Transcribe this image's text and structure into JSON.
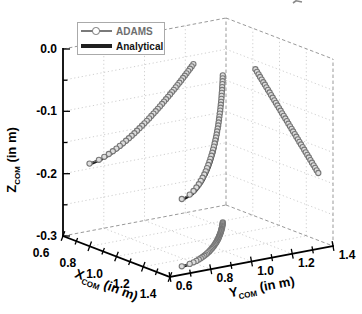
{
  "colors": {
    "background": "#ffffff",
    "axis": "#000000",
    "grid": "#c9c9c9",
    "box_dash": "#999999",
    "adams_stroke": "#777777",
    "adams_fill": "#dddddd",
    "analytical": "#202020",
    "legend_border": "#aaaaaa",
    "tick_text": "#000000"
  },
  "axes": {
    "x": {
      "sym": "X",
      "sub": "COM",
      "unit": " (in m)",
      "min": 0.6,
      "max": 1.4,
      "tick_values": [
        0.6,
        0.8,
        1.0,
        1.2,
        1.4
      ],
      "tick_labels": [
        "0.6",
        "0.8",
        "1.0",
        "1.2",
        "1.4"
      ],
      "minor_tick_step": 0.1
    },
    "y": {
      "sym": "Y",
      "sub": "COM",
      "unit": " (in m)",
      "min": 0.6,
      "max": 1.4,
      "tick_values": [
        0.6,
        0.8,
        1.0,
        1.2,
        1.4
      ],
      "tick_labels": [
        "0.6",
        "0.8",
        "1.0",
        "1.2",
        "1.4"
      ],
      "minor_tick_step": 0.1
    },
    "z": {
      "sym": "Z",
      "sub": "COM",
      "unit": " (in m)",
      "min": -0.3,
      "max": 0.0,
      "tick_values": [
        0,
        -0.1,
        -0.2,
        -0.3
      ],
      "tick_labels": [
        "0.0",
        "-0.1",
        "-0.2",
        "-0.3"
      ],
      "minor_tick_step": 0.05,
      "grid_step": 0.05
    }
  },
  "legend": {
    "position": "upper-left",
    "items": [
      {
        "label": "ADAMS",
        "marker": "circle-on-line",
        "color": "#777777"
      },
      {
        "label": "Analytical",
        "marker": "thick-line",
        "color": "#202020"
      }
    ]
  },
  "chart_data": {
    "type": "line",
    "plot_style": "3d-trajectory-with-wall-and-floor-projections",
    "title": "",
    "xlabel": "X_COM (in m)",
    "ylabel": "Y_COM (in m)",
    "zlabel": "Z_COM (in m)",
    "xlim": [
      0.6,
      1.4
    ],
    "ylim": [
      0.6,
      1.4
    ],
    "zlim": [
      -0.3,
      0.0
    ],
    "grid": true,
    "legend_position": "upper-left",
    "projections_drawn": [
      "floor z=-0.3",
      "wall x=0.6",
      "wall y=1.4",
      "main 3d curve"
    ],
    "series": [
      {
        "name": "ADAMS",
        "style": "line+circle-markers",
        "color": "#777777",
        "points3d": [
          [
            0.82,
            1.24,
            -0.064
          ],
          [
            0.8318,
            1.2317,
            -0.0672
          ],
          [
            0.8435,
            1.2233,
            -0.0704
          ],
          [
            0.8553,
            1.2148,
            -0.0736
          ],
          [
            0.867,
            1.2062,
            -0.0768
          ],
          [
            0.8788,
            1.1976,
            -0.08
          ],
          [
            0.8905,
            1.1889,
            -0.0832
          ],
          [
            0.9023,
            1.1801,
            -0.0864
          ],
          [
            0.914,
            1.1711,
            -0.0896
          ],
          [
            0.9258,
            1.1621,
            -0.0928
          ],
          [
            0.9375,
            1.153,
            -0.096
          ],
          [
            0.9493,
            1.1438,
            -0.0992
          ],
          [
            0.961,
            1.1345,
            -0.1024
          ],
          [
            0.9728,
            1.125,
            -0.1056
          ],
          [
            0.9845,
            1.1154,
            -0.1088
          ],
          [
            0.9963,
            1.1057,
            -0.112
          ],
          [
            1.008,
            1.0959,
            -0.1152
          ],
          [
            1.0198,
            1.0859,
            -0.1184
          ],
          [
            1.0315,
            1.0758,
            -0.1216
          ],
          [
            1.0433,
            1.0655,
            -0.1248
          ],
          [
            1.055,
            1.055,
            -0.128
          ],
          [
            1.0668,
            1.0444,
            -0.1312
          ],
          [
            1.0785,
            1.0335,
            -0.1344
          ],
          [
            1.0903,
            1.0224,
            -0.1376
          ],
          [
            1.102,
            1.0111,
            -0.1408
          ],
          [
            1.1138,
            0.9996,
            -0.144
          ],
          [
            1.1255,
            0.9878,
            -0.1472
          ],
          [
            1.1373,
            0.9756,
            -0.1504
          ],
          [
            1.149,
            0.9632,
            -0.1536
          ],
          [
            1.1608,
            0.9504,
            -0.1568
          ],
          [
            1.1725,
            0.9371,
            -0.16
          ],
          [
            1.1843,
            0.9234,
            -0.1632
          ],
          [
            1.196,
            0.9091,
            -0.1664
          ],
          [
            1.2078,
            0.8943,
            -0.1696
          ],
          [
            1.2195,
            0.8786,
            -0.1728
          ],
          [
            1.2313,
            0.862,
            -0.176
          ],
          [
            1.243,
            0.8442,
            -0.1792
          ],
          [
            1.2548,
            0.8247,
            -0.1824
          ],
          [
            1.2665,
            0.8028,
            -0.1856
          ],
          [
            1.2783,
            0.7764,
            -0.1888
          ],
          [
            1.29,
            0.73,
            -0.192
          ]
        ]
      },
      {
        "name": "Analytical",
        "style": "solid-line",
        "color": "#202020",
        "points3d": [
          [
            0.82,
            1.24,
            -0.064
          ],
          [
            0.8318,
            1.2321,
            -0.0672
          ],
          [
            0.8435,
            1.224,
            -0.0704
          ],
          [
            0.8553,
            1.2159,
            -0.0736
          ],
          [
            0.867,
            1.2076,
            -0.0768
          ],
          [
            0.8788,
            1.1994,
            -0.08
          ],
          [
            0.8905,
            1.191,
            -0.0832
          ],
          [
            0.9023,
            1.1826,
            -0.0864
          ],
          [
            0.914,
            1.1739,
            -0.0896
          ],
          [
            0.9258,
            1.1653,
            -0.0928
          ],
          [
            0.9375,
            1.1565,
            -0.096
          ],
          [
            0.9493,
            1.1477,
            -0.0992
          ],
          [
            0.961,
            1.1387,
            -0.1024
          ],
          [
            0.9728,
            1.1296,
            -0.1056
          ],
          [
            0.9845,
            1.1203,
            -0.1088
          ],
          [
            0.9963,
            1.111,
            -0.112
          ],
          [
            1.008,
            1.1015,
            -0.1152
          ],
          [
            1.0198,
            1.0919,
            -0.1184
          ],
          [
            1.0315,
            1.0821,
            -0.1216
          ],
          [
            1.0433,
            1.0722,
            -0.1248
          ],
          [
            1.055,
            1.062,
            -0.128
          ],
          [
            1.0668,
            1.0518,
            -0.1312
          ],
          [
            1.0785,
            1.0412,
            -0.1344
          ],
          [
            1.0903,
            1.0305,
            -0.1376
          ],
          [
            1.102,
            1.0195,
            -0.1408
          ],
          [
            1.1138,
            1.0084,
            -0.144
          ],
          [
            1.1255,
            0.9969,
            -0.1472
          ],
          [
            1.1373,
            0.9851,
            -0.1504
          ],
          [
            1.149,
            0.973,
            -0.1536
          ],
          [
            1.1608,
            0.9606,
            -0.1568
          ],
          [
            1.1725,
            0.9476,
            -0.16
          ],
          [
            1.1843,
            0.9343,
            -0.1632
          ],
          [
            1.196,
            0.9203,
            -0.1664
          ],
          [
            1.2078,
            0.9059,
            -0.1696
          ],
          [
            1.2195,
            0.8905,
            -0.1728
          ],
          [
            1.2313,
            0.8743,
            -0.176
          ],
          [
            1.243,
            0.8568,
            -0.1792
          ],
          [
            1.2548,
            0.8377,
            -0.1824
          ],
          [
            1.2665,
            0.8161,
            -0.1856
          ],
          [
            1.2783,
            0.7901,
            -0.1888
          ],
          [
            1.29,
            0.744,
            -0.192
          ]
        ]
      }
    ]
  }
}
